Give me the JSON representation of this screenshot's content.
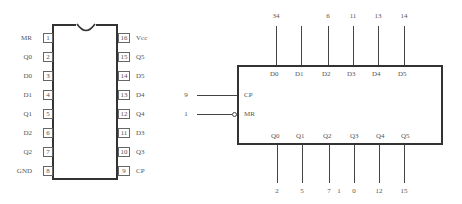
{
  "dip_package": {
    "left_pins": [
      {
        "number": "1",
        "label": "MR"
      },
      {
        "number": "2",
        "label": "Q0"
      },
      {
        "number": "3",
        "label": "D0"
      },
      {
        "number": "4",
        "label": "D1"
      },
      {
        "number": "5",
        "label": "Q1"
      },
      {
        "number": "6",
        "label": "D2"
      },
      {
        "number": "7",
        "label": "Q2"
      },
      {
        "number": "8",
        "label": "GND"
      }
    ],
    "right_pins": [
      {
        "number": "16",
        "label": "Vcc"
      },
      {
        "number": "15",
        "label": "Q5"
      },
      {
        "number": "14",
        "label": "D5"
      },
      {
        "number": "13",
        "label": "D4"
      },
      {
        "number": "12",
        "label": "Q4"
      },
      {
        "number": "11",
        "label": "D3"
      },
      {
        "number": "10",
        "label": "Q3"
      },
      {
        "number": "9",
        "label": "CP"
      }
    ]
  },
  "logic_symbol": {
    "inputs_top": [
      {
        "label": "D0",
        "pin": "34"
      },
      {
        "label": "D1",
        "pin": ""
      },
      {
        "label": "D2",
        "pin": "6"
      },
      {
        "label": "D3",
        "pin": "11"
      },
      {
        "label": "D4",
        "pin": "13"
      },
      {
        "label": "D5",
        "pin": "14"
      }
    ],
    "outputs_bottom": [
      {
        "label": "Q0",
        "pin": "2"
      },
      {
        "label": "Q1",
        "pin": "5"
      },
      {
        "label": "Q2",
        "pin": "7"
      },
      {
        "label": "Q3",
        "pin": "0"
      },
      {
        "label": "Q4",
        "pin": "12"
      },
      {
        "label": "Q5",
        "pin": "15"
      }
    ],
    "stray_label": "1",
    "left_inputs": [
      {
        "label": "CP",
        "pin": "9",
        "inverted": false
      },
      {
        "label": "MR",
        "pin": "1",
        "inverted": true
      }
    ]
  }
}
